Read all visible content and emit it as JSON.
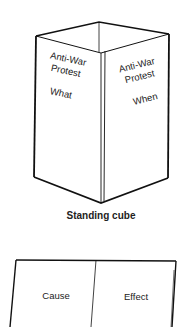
{
  "standing_cube": {
    "left_panel": {
      "line1": "Anti-War",
      "line2": "Protest",
      "line3": "What"
    },
    "right_panel": {
      "line1": "Anti-War",
      "line2": "Protest",
      "line3": "When"
    },
    "caption": "Standing cube"
  },
  "tent_fold": {
    "left_panel": {
      "label": "Cause"
    },
    "right_panel": {
      "label": "Effect"
    }
  },
  "colors": {
    "stroke": "#111111",
    "text": "#222222",
    "background": "#ffffff"
  }
}
